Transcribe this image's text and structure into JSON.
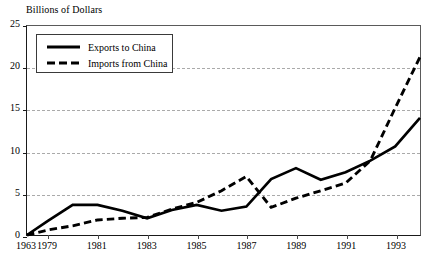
{
  "chart_data": {
    "type": "line",
    "title": "Billions of Dollars",
    "xlabel": "",
    "ylabel": "Billions of Dollars",
    "ylim": [
      0,
      25
    ],
    "yticks": [
      0,
      5,
      10,
      15,
      20,
      25
    ],
    "xtick_labels": [
      "1963",
      "1979",
      "1981",
      "1983",
      "1985",
      "1987",
      "1989",
      "1991",
      "1993"
    ],
    "xtick_years": [
      1963,
      1979,
      1981,
      1983,
      1985,
      1987,
      1989,
      1991,
      1993
    ],
    "xlim": [
      1963,
      1994
    ],
    "x_axis_note": "1963 at axis origin, then continuous annual scale from 1979 to 1994",
    "grid": "horizontal dashed gridlines at 5, 10, 15, 20",
    "legend_position": "upper-left inside plot",
    "x": [
      1963,
      1979,
      1980,
      1981,
      1982,
      1983,
      1984,
      1985,
      1986,
      1987,
      1988,
      1989,
      1990,
      1991,
      1992,
      1993,
      1994
    ],
    "series": [
      {
        "name": "Exports to China",
        "style": "solid",
        "color": "#000000",
        "values": [
          0.0,
          1.7,
          3.6,
          3.6,
          2.9,
          2.0,
          3.0,
          3.6,
          2.9,
          3.4,
          6.7,
          8.0,
          6.6,
          7.5,
          8.9,
          10.6,
          14.0
        ]
      },
      {
        "name": "Imports from China",
        "style": "dashed",
        "color": "#000000",
        "values": [
          0.0,
          0.6,
          1.1,
          1.8,
          2.0,
          2.1,
          3.1,
          3.9,
          5.3,
          7.0,
          3.3,
          4.4,
          5.3,
          6.2,
          8.9,
          15.2,
          21.3
        ]
      }
    ]
  },
  "legend": {
    "items": [
      {
        "label": "Exports to China",
        "style": "solid"
      },
      {
        "label": "Imports from China",
        "style": "dashed"
      }
    ]
  }
}
